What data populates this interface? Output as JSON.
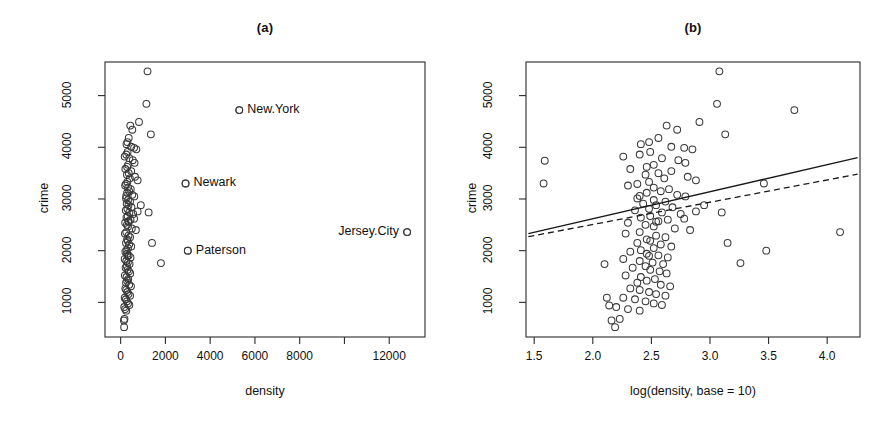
{
  "figure": {
    "background": "#ffffff",
    "point_color": "#3a3a3a",
    "line_color": "#1a1a1a"
  },
  "chart_data": [
    {
      "type": "scatter",
      "title": "(a)",
      "xlabel": "density",
      "ylabel": "crime",
      "xlim": [
        -700,
        13600
      ],
      "ylim": [
        330,
        5650
      ],
      "xticks": [
        0,
        2000,
        4000,
        6000,
        8000,
        10000,
        12000
      ],
      "xticklabels": [
        "0",
        "2000",
        "4000",
        "6000",
        "8000",
        "",
        "12000"
      ],
      "yticks": [
        1000,
        2000,
        3000,
        4000,
        5000
      ],
      "yticklabels": [
        "1000",
        "2000",
        "3000",
        "4000",
        "5000"
      ],
      "grid": false,
      "legend": "none",
      "annotations": [
        {
          "text": "New.York",
          "x": 5300,
          "y": 4720,
          "position": "right"
        },
        {
          "text": "Newark",
          "x": 2900,
          "y": 3300,
          "position": "right"
        },
        {
          "text": "Paterson",
          "x": 3000,
          "y": 2000,
          "position": "right"
        },
        {
          "text": "Jersey.City",
          "x": 12800,
          "y": 2360,
          "position": "left"
        }
      ],
      "x": [
        5300,
        2900,
        3000,
        12800,
        1200,
        1150,
        820,
        430,
        520,
        360,
        300,
        260,
        470,
        600,
        700,
        1350,
        310,
        250,
        180,
        390,
        540,
        620,
        330,
        290,
        210,
        470,
        360,
        280,
        640,
        410,
        760,
        300,
        240,
        200,
        330,
        450,
        380,
        290,
        520,
        610,
        240,
        330,
        420,
        270,
        350,
        480,
        300,
        230,
        390,
        560,
        310,
        260,
        440,
        360,
        200,
        280,
        330,
        500,
        680,
        760,
        250,
        190,
        350,
        420,
        290,
        310,
        240,
        380,
        470,
        900,
        1250,
        330,
        260,
        210,
        290,
        360,
        440,
        180,
        250,
        320,
        400,
        1400,
        1800,
        280,
        220,
        310,
        370,
        430,
        190,
        260,
        340,
        290,
        240,
        380,
        460,
        210,
        250,
        300,
        350,
        420,
        180,
        230,
        280,
        330,
        390,
        160,
        200,
        250,
        170,
        145,
        155,
        300,
        350,
        250,
        600
      ],
      "y": [
        4720,
        3300,
        2000,
        2360,
        5470,
        4840,
        4490,
        4420,
        4340,
        4180,
        4100,
        4060,
        4010,
        3990,
        3960,
        4250,
        3910,
        3860,
        3820,
        3790,
        3750,
        3700,
        3660,
        3620,
        3580,
        3540,
        3500,
        3470,
        3430,
        3400,
        3360,
        3330,
        3290,
        3260,
        3220,
        3190,
        3150,
        3120,
        3080,
        3050,
        3010,
        2980,
        2950,
        2910,
        2880,
        2840,
        2810,
        2780,
        2740,
        2710,
        2670,
        2640,
        2600,
        2570,
        2540,
        2500,
        2470,
        2430,
        2400,
        2760,
        2360,
        2330,
        2290,
        2260,
        2220,
        2190,
        2150,
        2120,
        2080,
        2880,
        2740,
        2050,
        2010,
        1980,
        1940,
        1910,
        1870,
        1840,
        1800,
        1770,
        1740,
        2150,
        1760,
        1700,
        1670,
        1630,
        1600,
        1560,
        1520,
        1490,
        1450,
        1420,
        1380,
        1340,
        1310,
        1270,
        1240,
        1200,
        1160,
        1130,
        1090,
        1060,
        1020,
        980,
        950,
        910,
        870,
        840,
        680,
        650,
        520,
        1900,
        2560,
        3060,
        2620
      ]
    },
    {
      "type": "scatter",
      "title": "(b)",
      "xlabel": "log(density, base = 10)",
      "ylabel": "crime",
      "xlim": [
        1.43,
        4.28
      ],
      "ylim": [
        330,
        5650
      ],
      "xticks": [
        1.5,
        2.0,
        2.5,
        3.0,
        3.5,
        4.0
      ],
      "xticklabels": [
        "1.5",
        "2.0",
        "2.5",
        "3.0",
        "3.5",
        "4.0"
      ],
      "yticks": [
        1000,
        2000,
        3000,
        4000,
        5000
      ],
      "yticklabels": [
        "1000",
        "2000",
        "3000",
        "4000",
        "5000"
      ],
      "grid": false,
      "legend": "none",
      "annotations": [],
      "lines": [
        {
          "name": "ols-fit",
          "style": "solid",
          "x0": 1.45,
          "y0": 2330,
          "x1": 4.26,
          "y1": 3800
        },
        {
          "name": "robust-fit",
          "style": "dashed",
          "x0": 1.45,
          "y0": 2270,
          "x1": 4.26,
          "y1": 3480
        }
      ],
      "x": [
        3.72,
        3.46,
        3.48,
        4.11,
        3.08,
        3.06,
        2.91,
        2.63,
        2.72,
        2.56,
        2.48,
        2.41,
        2.67,
        2.78,
        2.85,
        3.13,
        2.49,
        2.4,
        2.26,
        2.59,
        2.73,
        2.79,
        2.52,
        2.46,
        2.32,
        2.67,
        2.56,
        2.45,
        2.81,
        2.61,
        2.88,
        2.48,
        2.38,
        2.3,
        2.52,
        2.65,
        2.58,
        2.46,
        2.72,
        2.79,
        2.38,
        2.52,
        2.62,
        2.43,
        2.54,
        2.68,
        2.48,
        2.36,
        2.59,
        2.75,
        2.49,
        2.41,
        2.64,
        2.56,
        2.3,
        2.45,
        2.52,
        2.7,
        2.83,
        2.88,
        2.4,
        2.28,
        2.54,
        2.62,
        2.46,
        2.49,
        2.38,
        2.58,
        2.67,
        2.95,
        3.1,
        2.52,
        2.41,
        2.32,
        2.46,
        2.56,
        2.64,
        2.26,
        2.4,
        2.51,
        2.6,
        3.15,
        3.26,
        2.45,
        2.34,
        2.49,
        2.57,
        2.63,
        2.28,
        2.41,
        2.53,
        2.46,
        2.38,
        2.58,
        2.66,
        2.32,
        2.4,
        2.48,
        2.54,
        2.62,
        2.26,
        2.36,
        2.45,
        2.52,
        2.59,
        2.2,
        2.3,
        2.4,
        2.23,
        2.16,
        2.19,
        2.48,
        2.54,
        2.4,
        2.78,
        1.59,
        1.58,
        2.1,
        2.12,
        2.14
      ],
      "y": [
        4720,
        3300,
        2000,
        2360,
        5470,
        4840,
        4490,
        4420,
        4340,
        4180,
        4100,
        4060,
        4010,
        3990,
        3960,
        4250,
        3910,
        3860,
        3820,
        3790,
        3750,
        3700,
        3660,
        3620,
        3580,
        3540,
        3500,
        3470,
        3430,
        3400,
        3360,
        3330,
        3290,
        3260,
        3220,
        3190,
        3150,
        3120,
        3080,
        3050,
        3010,
        2980,
        2950,
        2910,
        2880,
        2840,
        2810,
        2780,
        2740,
        2710,
        2670,
        2640,
        2600,
        2570,
        2540,
        2500,
        2470,
        2430,
        2400,
        2760,
        2360,
        2330,
        2290,
        2260,
        2220,
        2190,
        2150,
        2120,
        2080,
        2880,
        2740,
        2050,
        2010,
        1980,
        1940,
        1910,
        1870,
        1840,
        1800,
        1770,
        1740,
        2150,
        1760,
        1700,
        1670,
        1630,
        1600,
        1560,
        1520,
        1490,
        1450,
        1420,
        1380,
        1340,
        1310,
        1270,
        1240,
        1200,
        1160,
        1130,
        1090,
        1060,
        1020,
        980,
        950,
        910,
        870,
        840,
        680,
        650,
        520,
        1900,
        2560,
        3060,
        2620,
        3740,
        3300,
        1740,
        1090,
        940
      ]
    }
  ]
}
